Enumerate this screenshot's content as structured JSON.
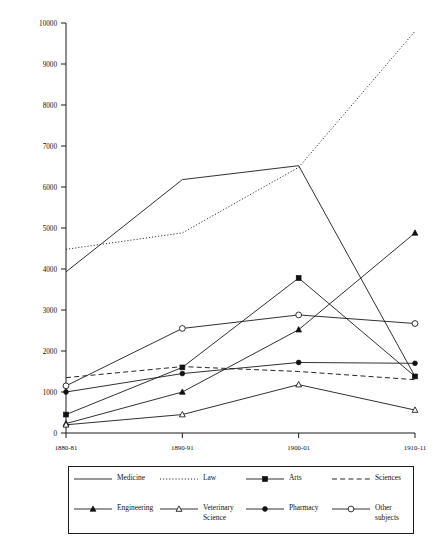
{
  "chart_data": {
    "type": "line",
    "title": "",
    "subtitle": "",
    "xlabel": "",
    "ylabel": "",
    "categories": [
      "1880-81",
      "1890-91",
      "1900-01",
      "1910-11"
    ],
    "ylim": [
      0,
      10000
    ],
    "ytick_step": 1000,
    "yticks": [
      "0",
      "1000",
      "2000",
      "3000",
      "4000",
      "5000",
      "6000",
      "7000",
      "8000",
      "9000",
      "10000"
    ],
    "grid": false,
    "legend_position": "bottom",
    "legend_columns": 4,
    "series": [
      {
        "name": "Medicine",
        "line_style": "solid",
        "marker": "none",
        "values": [
          3930,
          6180,
          6520,
          1380
        ]
      },
      {
        "name": "Law",
        "line_style": "dotted",
        "marker": "none",
        "values": [
          4480,
          4880,
          6480,
          9800
        ]
      },
      {
        "name": "Arts",
        "line_style": "solid",
        "marker": "square-filled",
        "values": [
          450,
          1600,
          3780,
          1380
        ]
      },
      {
        "name": "Sciences",
        "line_style": "dashed",
        "marker": "none",
        "values": [
          1350,
          1620,
          1500,
          1300
        ]
      },
      {
        "name": "Engineering",
        "line_style": "solid",
        "marker": "triangle-filled",
        "values": [
          230,
          1000,
          2520,
          4880
        ]
      },
      {
        "name": "Veterinary Science",
        "line_style": "solid",
        "marker": "triangle-open",
        "values": [
          200,
          450,
          1180,
          560
        ]
      },
      {
        "name": "Pharmacy",
        "line_style": "solid",
        "marker": "circle-filled",
        "values": [
          1000,
          1450,
          1720,
          1700
        ]
      },
      {
        "name": "Other subjects",
        "line_style": "solid",
        "marker": "circle-open",
        "values": [
          1150,
          2550,
          2880,
          2670
        ]
      }
    ]
  },
  "legend": {
    "row1": [
      {
        "label": "Medicine",
        "icon": "solid-line-swatch"
      },
      {
        "label": "Law",
        "icon": "dotted-line-swatch"
      },
      {
        "label": "Arts",
        "icon": "square-marker-swatch"
      },
      {
        "label": "Sciences",
        "icon": "dashed-line-swatch"
      }
    ],
    "row2": [
      {
        "label": "Engineering",
        "icon": "triangle-filled-marker-swatch"
      },
      {
        "label": "Veterinary\nScience",
        "icon": "triangle-open-marker-swatch"
      },
      {
        "label": "Pharmacy",
        "icon": "circle-filled-marker-swatch"
      },
      {
        "label": "Other\nsubjects",
        "icon": "circle-open-marker-swatch"
      }
    ]
  },
  "colors": {
    "ink": "#111111",
    "background": "#ffffff"
  }
}
